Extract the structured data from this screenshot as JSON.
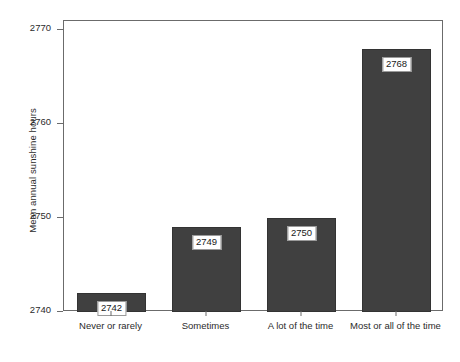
{
  "chart_data": {
    "type": "bar",
    "title": "",
    "xlabel": "",
    "ylabel": "Mean annual sunshine hours",
    "categories": [
      "Never or rarely",
      "Sometimes",
      "A lot of the time",
      "Most or all of the time"
    ],
    "values": [
      2742,
      2749,
      2750,
      2768
    ],
    "data_labels": [
      "2742",
      "2749",
      "2750",
      "2768"
    ],
    "ylim": [
      2740,
      2770
    ],
    "yticks": [
      2740,
      2750,
      2760,
      2770
    ],
    "ytick_labels": [
      "2740",
      "2750",
      "2760",
      "2770"
    ],
    "grid": false,
    "legend": false,
    "bar_color": "#404040",
    "axis_color": "#6b6b6b",
    "text_color": "#2b2b2b",
    "background": "#ffffff"
  }
}
